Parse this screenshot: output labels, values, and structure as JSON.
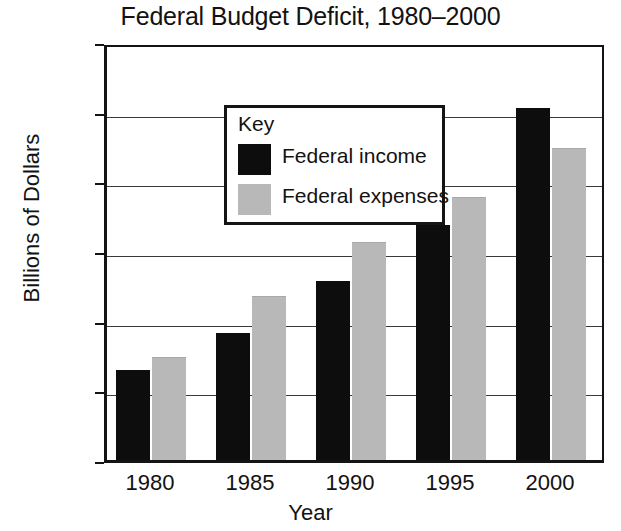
{
  "chart_data": {
    "type": "bar",
    "title": "Federal Budget Deficit, 1980–2000",
    "xlabel": "Year",
    "ylabel": "Billions of Dollars",
    "categories": [
      "1980",
      "1985",
      "1990",
      "1995",
      "2000"
    ],
    "series": [
      {
        "name": "Federal income",
        "color": "#0d0d0d",
        "values": [
          515,
          730,
          1030,
          1350,
          2020
        ]
      },
      {
        "name": "Federal expenses",
        "color": "#b8b8b8",
        "values": [
          590,
          940,
          1250,
          1510,
          1790
        ]
      }
    ],
    "ylim": [
      0,
      2400
    ],
    "ytick_values": [
      0,
      400,
      800,
      1200,
      1600,
      2000,
      2400
    ],
    "ytick_labels": [
      "0",
      "400",
      "800",
      "1,200",
      "1,600",
      "2,000",
      "2,400"
    ],
    "grid": true,
    "legend": {
      "title": "Key",
      "position": "upper-left-inside"
    }
  }
}
